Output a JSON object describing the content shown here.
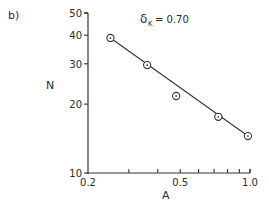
{
  "panel_label": "b)",
  "annotation": {
    "symbol": "δ",
    "subscript": "K",
    "text": "= 0.70"
  },
  "chart_data": {
    "type": "scatter",
    "title": "",
    "panel": "b)",
    "xlabel": "A",
    "ylabel": "N",
    "xscale": "log",
    "yscale": "log",
    "xlim": [
      0.2,
      1.0
    ],
    "ylim": [
      10,
      50
    ],
    "x_ticks": [
      0.2,
      0.3,
      0.4,
      0.5,
      0.6,
      0.7,
      0.8,
      0.9,
      1.0
    ],
    "x_tick_labels": [
      "0.2",
      "",
      "",
      "0.5",
      "",
      "",
      "",
      "",
      "1.0"
    ],
    "y_ticks": [
      10,
      20,
      30,
      40,
      50
    ],
    "y_tick_labels": [
      "10",
      "20",
      "30",
      "40",
      "50"
    ],
    "grid": false,
    "annotation": "δK = 0.70",
    "series": [
      {
        "name": "data",
        "marker": "circled-dot",
        "x": [
          0.25,
          0.36,
          0.48,
          0.73,
          0.98
        ],
        "y": [
          38.9,
          29.6,
          21.7,
          17.6,
          14.5
        ]
      },
      {
        "name": "fit",
        "style": "line",
        "x": [
          0.25,
          0.98
        ],
        "y": [
          38.9,
          14.5
        ]
      }
    ]
  }
}
